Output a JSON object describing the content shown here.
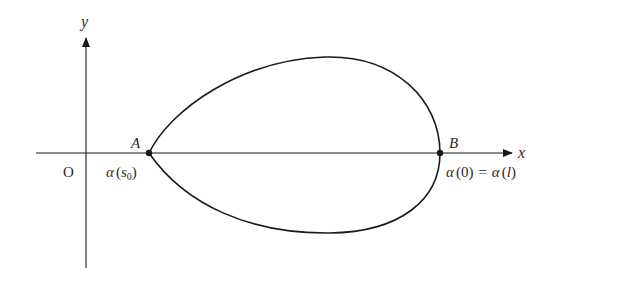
{
  "diagram": {
    "axes": {
      "x_label": "x",
      "y_label": "y",
      "origin_label": "O"
    },
    "points": [
      {
        "id": "A",
        "label": "A",
        "annotation_func": "α",
        "annotation_arg": "s",
        "annotation_sub": "0"
      },
      {
        "id": "B",
        "label": "B",
        "annotation": "α(0) = α(l)",
        "annotation_left_func": "α",
        "annotation_left_arg": "0",
        "annotation_eq": "=",
        "annotation_right_func": "α",
        "annotation_right_arg": "l"
      }
    ],
    "curve": {
      "description": "closed egg-shaped curve crossing the x-axis at A and B"
    },
    "colors": {
      "stroke": "#1a1a1a",
      "text": "#2a2a2a",
      "background": "#ffffff"
    }
  }
}
